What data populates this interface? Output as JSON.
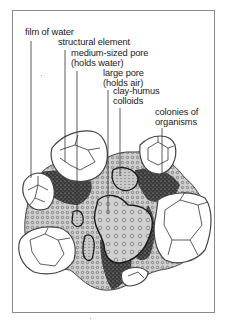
{
  "figure": {
    "labels": [
      {
        "id": "film-of-water",
        "text": "film of water"
      },
      {
        "id": "structural-element",
        "text": "structural element"
      },
      {
        "id": "medium-pore",
        "text": "medium-sized pore\n(holds water)"
      },
      {
        "id": "large-pore",
        "text": "large pore\n(holds air)"
      },
      {
        "id": "clay-humus",
        "text": "clay-humus\ncolloids"
      },
      {
        "id": "colonies",
        "text": "colonies of\norganisms"
      }
    ]
  },
  "colors": {
    "frame": "#8a8a8a",
    "outline": "#333333",
    "dark_fill": "#2a2a2a",
    "mid_fill": "#b5b5b5",
    "light_fill": "#d6d6d6",
    "background": "#ffffff"
  }
}
